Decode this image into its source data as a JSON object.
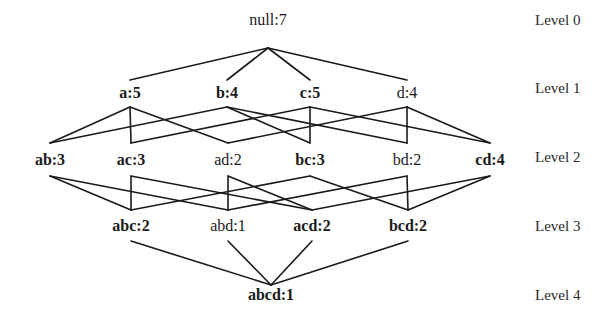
{
  "levels": [
    {
      "label": "Level 0",
      "y": 20
    },
    {
      "label": "Level 1",
      "y": 88
    },
    {
      "label": "Level 2",
      "y": 157
    },
    {
      "label": "Level 3",
      "y": 226
    },
    {
      "label": "Level 4",
      "y": 295
    }
  ],
  "nodes": {
    "null": {
      "label": "null:7",
      "x": 268,
      "y": 20,
      "top": 10,
      "bottom": 48,
      "bold": false
    },
    "a": {
      "label": "a:5",
      "x": 130,
      "y": 93,
      "top": 80,
      "bottom": 107,
      "bold": true
    },
    "b": {
      "label": "b:4",
      "x": 227,
      "y": 93,
      "top": 80,
      "bottom": 107,
      "bold": true
    },
    "c": {
      "label": "c:5",
      "x": 310,
      "y": 93,
      "top": 80,
      "bottom": 107,
      "bold": true
    },
    "d": {
      "label": "d:4",
      "x": 407,
      "y": 93,
      "top": 80,
      "bottom": 107,
      "bold": false
    },
    "ab": {
      "label": "ab:3",
      "x": 50,
      "y": 160,
      "top": 143,
      "bottom": 176,
      "bold": true
    },
    "ac": {
      "label": "ac:3",
      "x": 131,
      "y": 160,
      "top": 143,
      "bottom": 176,
      "bold": true
    },
    "ad": {
      "label": "ad:2",
      "x": 228,
      "y": 160,
      "top": 143,
      "bottom": 176,
      "bold": false
    },
    "bc": {
      "label": "bc:3",
      "x": 310,
      "y": 160,
      "top": 143,
      "bottom": 176,
      "bold": true
    },
    "bd": {
      "label": "bd:2",
      "x": 407,
      "y": 160,
      "top": 143,
      "bottom": 176,
      "bold": false
    },
    "cd": {
      "label": "cd:4",
      "x": 490,
      "y": 160,
      "top": 143,
      "bottom": 176,
      "bold": true
    },
    "abc": {
      "label": "abc:2",
      "x": 131,
      "y": 226,
      "top": 210,
      "bottom": 241,
      "bold": true
    },
    "abd": {
      "label": "abd:1",
      "x": 228,
      "y": 226,
      "top": 210,
      "bottom": 241,
      "bold": false
    },
    "acd": {
      "label": "acd:2",
      "x": 312,
      "y": 226,
      "top": 210,
      "bottom": 241,
      "bold": true
    },
    "bcd": {
      "label": "bcd:2",
      "x": 408,
      "y": 226,
      "top": 210,
      "bottom": 241,
      "bold": true
    },
    "abcd": {
      "label": "abcd:1",
      "x": 271,
      "y": 295,
      "top": 285,
      "bottom": 310,
      "bold": true
    }
  },
  "edges": [
    [
      "null",
      "a"
    ],
    [
      "null",
      "b"
    ],
    [
      "null",
      "c"
    ],
    [
      "null",
      "d"
    ],
    [
      "a",
      "ab"
    ],
    [
      "a",
      "ac"
    ],
    [
      "a",
      "ad"
    ],
    [
      "b",
      "ab"
    ],
    [
      "b",
      "bc"
    ],
    [
      "b",
      "bd"
    ],
    [
      "c",
      "ac"
    ],
    [
      "c",
      "bc"
    ],
    [
      "c",
      "cd"
    ],
    [
      "d",
      "ad"
    ],
    [
      "d",
      "bd"
    ],
    [
      "d",
      "cd"
    ],
    [
      "ab",
      "abc"
    ],
    [
      "ab",
      "abd"
    ],
    [
      "ac",
      "abc"
    ],
    [
      "ac",
      "acd"
    ],
    [
      "ad",
      "abd"
    ],
    [
      "ad",
      "acd"
    ],
    [
      "bc",
      "abc"
    ],
    [
      "bc",
      "bcd"
    ],
    [
      "bd",
      "abd"
    ],
    [
      "bd",
      "bcd"
    ],
    [
      "cd",
      "acd"
    ],
    [
      "cd",
      "bcd"
    ],
    [
      "abc",
      "abcd"
    ],
    [
      "abd",
      "abcd"
    ],
    [
      "acd",
      "abcd"
    ],
    [
      "bcd",
      "abcd"
    ]
  ],
  "colors": {
    "line": "#1a1a1a",
    "text": "#1a1a1a",
    "background": "#ffffff"
  }
}
